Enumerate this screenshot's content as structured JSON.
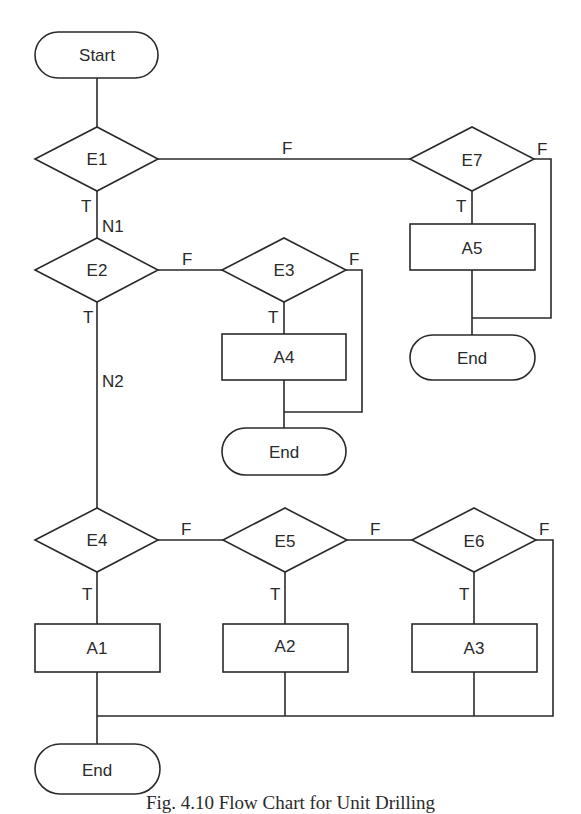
{
  "diagram": {
    "type": "flowchart",
    "nodes": {
      "start": {
        "label": "Start",
        "shape": "terminator"
      },
      "e1": {
        "label": "E1",
        "shape": "decision"
      },
      "e2": {
        "label": "E2",
        "shape": "decision"
      },
      "e3": {
        "label": "E3",
        "shape": "decision"
      },
      "e4": {
        "label": "E4",
        "shape": "decision"
      },
      "e5": {
        "label": "E5",
        "shape": "decision"
      },
      "e6": {
        "label": "E6",
        "shape": "decision"
      },
      "e7": {
        "label": "E7",
        "shape": "decision"
      },
      "a1": {
        "label": "A1",
        "shape": "process"
      },
      "a2": {
        "label": "A2",
        "shape": "process"
      },
      "a3": {
        "label": "A3",
        "shape": "process"
      },
      "a4": {
        "label": "A4",
        "shape": "process"
      },
      "a5": {
        "label": "A5",
        "shape": "process"
      },
      "end_a4": {
        "label": "End",
        "shape": "terminator"
      },
      "end_a5": {
        "label": "End",
        "shape": "terminator"
      },
      "end_main": {
        "label": "End",
        "shape": "terminator"
      }
    },
    "edge_labels": {
      "true": "T",
      "false": "F",
      "n1": "N1",
      "n2": "N2"
    },
    "edges": [
      {
        "from": "start",
        "to": "e1"
      },
      {
        "from": "e1",
        "to": "e2",
        "label": "T",
        "node_label": "N1"
      },
      {
        "from": "e1",
        "to": "e7",
        "label": "F"
      },
      {
        "from": "e7",
        "to": "a5",
        "label": "T"
      },
      {
        "from": "e7",
        "to": "end_a5",
        "label": "F"
      },
      {
        "from": "a5",
        "to": "end_a5"
      },
      {
        "from": "e2",
        "to": "e4",
        "label": "T",
        "node_label": "N2"
      },
      {
        "from": "e2",
        "to": "e3",
        "label": "F"
      },
      {
        "from": "e3",
        "to": "a4",
        "label": "T"
      },
      {
        "from": "e3",
        "to": "end_a4",
        "label": "F"
      },
      {
        "from": "a4",
        "to": "end_a4"
      },
      {
        "from": "e4",
        "to": "a1",
        "label": "T"
      },
      {
        "from": "e4",
        "to": "e5",
        "label": "F"
      },
      {
        "from": "e5",
        "to": "a2",
        "label": "T"
      },
      {
        "from": "e5",
        "to": "e6",
        "label": "F"
      },
      {
        "from": "e6",
        "to": "a3",
        "label": "T"
      },
      {
        "from": "e6",
        "to": "end_main",
        "label": "F"
      },
      {
        "from": "a1",
        "to": "end_main"
      },
      {
        "from": "a2",
        "to": "end_main"
      },
      {
        "from": "a3",
        "to": "end_main"
      }
    ],
    "caption": "Fig. 4.10  Flow Chart for Unit Drilling"
  }
}
